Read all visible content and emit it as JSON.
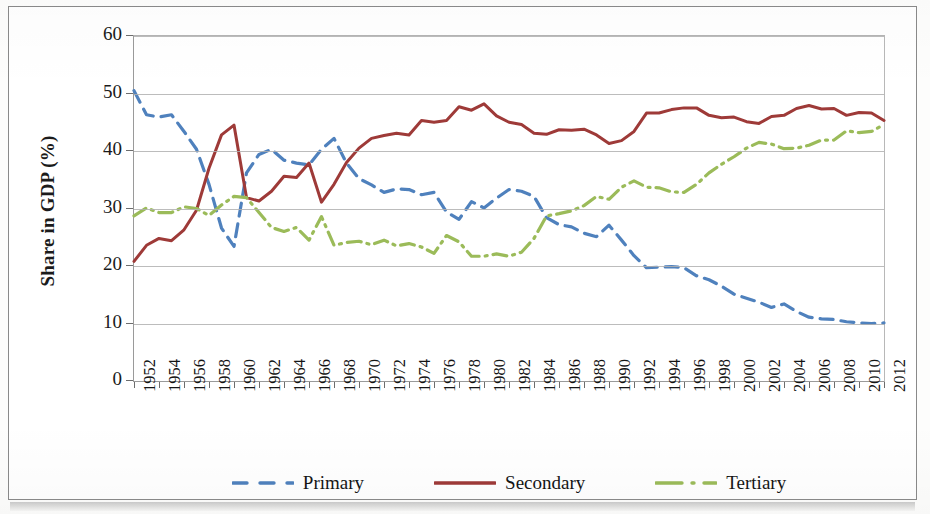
{
  "chart_data": {
    "type": "line",
    "title": "",
    "xlabel": "",
    "ylabel": "Share in GDP (%)",
    "ylim": [
      0,
      60
    ],
    "yticks": [
      0,
      10,
      20,
      30,
      40,
      50,
      60
    ],
    "xlim": [
      1952,
      2012
    ],
    "grid": true,
    "legend_position": "bottom",
    "xtick_labels": [
      "1952",
      "1954",
      "1956",
      "1958",
      "1960",
      "1962",
      "1964",
      "1966",
      "1968",
      "1970",
      "1972",
      "1974",
      "1976",
      "1978",
      "1980",
      "1982",
      "1984",
      "1986",
      "1988",
      "1990",
      "1992",
      "1994",
      "1996",
      "1998",
      "2000",
      "2002",
      "2004",
      "2006",
      "2008",
      "2010",
      "2012"
    ],
    "x": [
      1952,
      1953,
      1954,
      1955,
      1956,
      1957,
      1958,
      1959,
      1960,
      1961,
      1962,
      1963,
      1964,
      1965,
      1966,
      1967,
      1968,
      1969,
      1970,
      1971,
      1972,
      1973,
      1974,
      1975,
      1976,
      1977,
      1978,
      1979,
      1980,
      1981,
      1982,
      1983,
      1984,
      1985,
      1986,
      1987,
      1988,
      1989,
      1990,
      1991,
      1992,
      1993,
      1994,
      1995,
      1996,
      1997,
      1998,
      1999,
      2000,
      2001,
      2002,
      2003,
      2004,
      2005,
      2006,
      2007,
      2008,
      2009,
      2010,
      2011,
      2012
    ],
    "series": [
      {
        "name": "Primary",
        "color": "#4F81BD",
        "style": "dashed",
        "values": [
          50.5,
          46.3,
          45.9,
          46.3,
          43.4,
          40.3,
          34.2,
          26.6,
          23.4,
          36.2,
          39.4,
          40.3,
          38.4,
          37.9,
          37.6,
          40.3,
          42.2,
          37.9,
          35.2,
          34.1,
          32.8,
          33.4,
          33.3,
          32.4,
          32.8,
          29.4,
          28.1,
          31.2,
          30.1,
          31.8,
          33.3,
          33.0,
          32.1,
          28.4,
          27.2,
          26.8,
          25.7,
          25.1,
          27.1,
          24.5,
          21.8,
          19.7,
          19.8,
          19.9,
          19.7,
          18.3,
          17.6,
          16.5,
          15.1,
          14.4,
          13.7,
          12.8,
          13.4,
          12.1,
          11.1,
          10.8,
          10.7,
          10.3,
          10.1,
          10.0,
          10.1
        ]
      },
      {
        "name": "Secondary",
        "color": "#9E3A38",
        "style": "solid",
        "values": [
          20.8,
          23.6,
          24.8,
          24.4,
          26.3,
          29.7,
          37.0,
          42.8,
          44.5,
          31.9,
          31.3,
          33.0,
          35.6,
          35.4,
          37.9,
          31.1,
          34.2,
          38.0,
          40.5,
          42.2,
          42.7,
          43.1,
          42.8,
          45.3,
          45.0,
          45.3,
          47.7,
          47.1,
          48.2,
          46.1,
          45.0,
          44.6,
          43.1,
          42.9,
          43.7,
          43.6,
          43.8,
          42.8,
          41.3,
          41.8,
          43.4,
          46.6,
          46.6,
          47.2,
          47.5,
          47.5,
          46.2,
          45.8,
          45.9,
          45.1,
          44.8,
          46.0,
          46.2,
          47.4,
          47.9,
          47.3,
          47.4,
          46.2,
          46.7,
          46.6,
          45.3
        ]
      },
      {
        "name": "Tertiary",
        "color": "#9BBB59",
        "style": "dashdot",
        "values": [
          28.7,
          30.1,
          29.3,
          29.3,
          30.3,
          30.0,
          28.8,
          30.6,
          32.1,
          31.9,
          29.3,
          26.7,
          26.0,
          26.7,
          24.5,
          28.6,
          23.6,
          24.1,
          24.3,
          23.7,
          24.5,
          23.5,
          23.9,
          23.3,
          22.2,
          25.3,
          24.2,
          21.7,
          21.7,
          22.1,
          21.7,
          22.4,
          24.8,
          28.7,
          29.1,
          29.6,
          30.5,
          32.1,
          31.6,
          33.7,
          34.8,
          33.7,
          33.6,
          32.9,
          32.8,
          34.2,
          36.2,
          37.7,
          39.0,
          40.5,
          41.5,
          41.2,
          40.4,
          40.5,
          41.0,
          41.9,
          41.9,
          43.5,
          43.2,
          43.4,
          44.6
        ]
      }
    ]
  },
  "legend": {
    "items": [
      {
        "label": "Primary"
      },
      {
        "label": "Secondary"
      },
      {
        "label": "Tertiary"
      }
    ]
  },
  "axis": {
    "y_title": "Share in GDP (%)"
  }
}
